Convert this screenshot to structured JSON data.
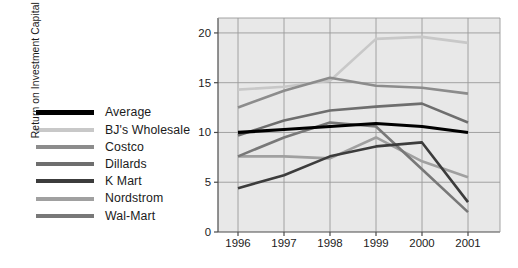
{
  "chart_data": {
    "type": "line",
    "title": "",
    "xlabel": "",
    "ylabel": "Return on Investment Capital (%)",
    "x": [
      "1996",
      "1997",
      "1998",
      "1999",
      "2000",
      "2001"
    ],
    "xticklabels": [
      "1996",
      "1997",
      "1998",
      "1999",
      "2000",
      "2001"
    ],
    "yticklabels": [
      "0",
      "5",
      "10",
      "15",
      "20"
    ],
    "yticks": [
      0,
      5,
      10,
      15,
      20
    ],
    "ylim": [
      0,
      21.5
    ],
    "grid": true,
    "legend_position": "left-outside",
    "plot_background": "#e8e8e8",
    "series": [
      {
        "name": "Average",
        "color": "#000000",
        "width": 3.2,
        "values": [
          10.0,
          10.3,
          10.6,
          10.9,
          10.6,
          10.0
        ]
      },
      {
        "name": "BJ's Wholesale",
        "color": "#c8c8c8",
        "width": 2.6,
        "values": [
          14.3,
          14.6,
          15.2,
          19.4,
          19.6,
          19.0
        ]
      },
      {
        "name": "Costco",
        "color": "#8c8c8c",
        "width": 2.6,
        "values": [
          12.5,
          14.2,
          15.5,
          14.7,
          14.5,
          13.9
        ]
      },
      {
        "name": "Dillards",
        "color": "#6e6e6e",
        "width": 2.6,
        "values": [
          9.7,
          11.2,
          12.2,
          12.6,
          12.9,
          11.0
        ]
      },
      {
        "name": "K Mart",
        "color": "#3c3c3c",
        "width": 2.6,
        "values": [
          4.4,
          5.7,
          7.6,
          8.6,
          9.0,
          3.0
        ]
      },
      {
        "name": "Nordstrom",
        "color": "#a0a0a0",
        "width": 2.6,
        "values": [
          7.6,
          7.6,
          7.4,
          9.5,
          7.1,
          5.5
        ]
      },
      {
        "name": "Wal-Mart",
        "color": "#787878",
        "width": 2.6,
        "values": [
          7.6,
          9.5,
          11.0,
          10.6,
          6.3,
          2.0
        ]
      }
    ]
  },
  "legend": {
    "items": [
      {
        "label": "Average",
        "color": "#000000"
      },
      {
        "label": "BJ's Wholesale",
        "color": "#c8c8c8"
      },
      {
        "label": "Costco",
        "color": "#8c8c8c"
      },
      {
        "label": "Dillards",
        "color": "#6e6e6e"
      },
      {
        "label": "K Mart",
        "color": "#3c3c3c"
      },
      {
        "label": "Nordstrom",
        "color": "#a0a0a0"
      },
      {
        "label": "Wal-Mart",
        "color": "#787878"
      }
    ]
  },
  "axis": {
    "y_title": "Return on Investment Capital (%)",
    "y_ticks": [
      "20",
      "15",
      "10",
      "5",
      "0"
    ],
    "x_ticks": [
      "1996",
      "1997",
      "1998",
      "1999",
      "2000",
      "2001"
    ]
  },
  "colors": {
    "plot_bg": "#e8e8e8",
    "grid": "#9a9a9a",
    "axis": "#4a4a4a",
    "text": "#1b1b1b"
  }
}
